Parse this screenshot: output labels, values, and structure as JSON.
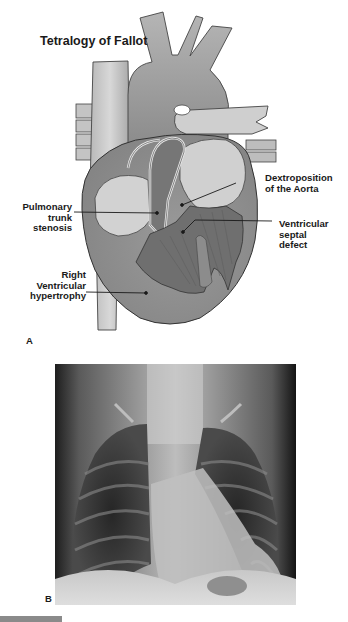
{
  "figure": {
    "panel_a": {
      "title": "Tetralogy of Fallot",
      "letter": "A",
      "labels": {
        "pulmonary": [
          "Pulmonary",
          "trunk",
          "stenosis"
        ],
        "aorta": [
          "Dextroposition",
          "of the Aorta"
        ],
        "vsd": [
          "Ventricular",
          "septal",
          "defect"
        ],
        "rvh": [
          "Right",
          "Ventricular",
          "hypertrophy"
        ]
      }
    },
    "panel_b": {
      "letter": "B",
      "description": "Chest radiograph"
    }
  },
  "colors": {
    "vessel_light": "#c9c9c9",
    "vessel_mid": "#9e9e9e",
    "heart_wall": "#8f8f8f",
    "chamber_dark": "#6f6f6f",
    "outline": "#333333",
    "text": "#1a1a1a"
  }
}
